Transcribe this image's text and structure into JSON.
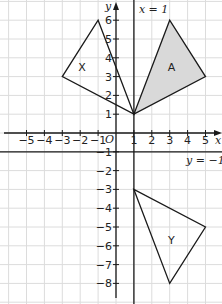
{
  "diagram": {
    "axes": {
      "x_label": "x",
      "y_label": "y",
      "origin_label": "O",
      "x_ticks": [
        "-5",
        "-4",
        "-3",
        "-2",
        "-1",
        "1",
        "2",
        "3",
        "4",
        "5"
      ],
      "y_ticks": [
        "6",
        "5",
        "4",
        "3",
        "2",
        "1",
        "-1",
        "-2",
        "-3",
        "-4",
        "-5",
        "-6",
        "-7",
        "-8"
      ]
    },
    "lines": {
      "vertical": {
        "label": "x = 1",
        "x": 1
      },
      "horizontal": {
        "label": "y = −1",
        "y": -1
      }
    },
    "shapes": [
      {
        "name": "A",
        "vertices": [
          [
            1,
            1
          ],
          [
            3,
            6
          ],
          [
            5,
            3
          ]
        ],
        "shaded": true
      },
      {
        "name": "X",
        "vertices": [
          [
            1,
            1
          ],
          [
            -1,
            6
          ],
          [
            -3,
            3
          ]
        ],
        "shaded": false
      },
      {
        "name": "Y",
        "vertices": [
          [
            1,
            -3
          ],
          [
            3,
            -8
          ],
          [
            5,
            -5
          ]
        ],
        "shaded": false
      }
    ],
    "colors": {
      "grid": "#dcdcdc",
      "stroke": "#1a1a1a",
      "shade": "#d9d9d9"
    }
  }
}
